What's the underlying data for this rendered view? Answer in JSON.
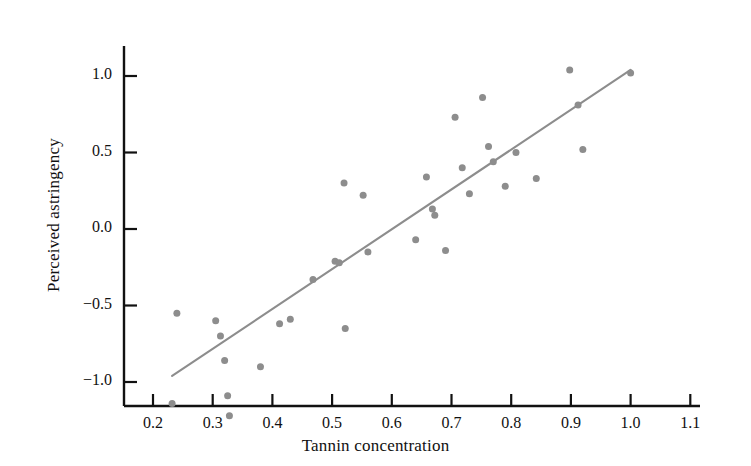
{
  "chart_data": {
    "type": "scatter",
    "title": "",
    "xlabel": "Tannin concentration",
    "ylabel": "Perceived astringency",
    "xlim": [
      0.155,
      1.155
    ],
    "ylim": [
      -1.27,
      1.17
    ],
    "xticks": [
      0.2,
      0.3,
      0.4,
      0.5,
      0.6,
      0.7,
      0.8,
      0.9,
      1.0,
      1.1
    ],
    "xticklabels": [
      "0.2",
      "0.3",
      "0.4",
      "0.5",
      "0.6",
      "0.7",
      "0.8",
      "0.9",
      "1.0",
      "1.1"
    ],
    "yticks": [
      -1.0,
      -0.5,
      0.0,
      0.5,
      1.0
    ],
    "yticklabels": [
      "-1.0",
      "-0.5",
      "0.0",
      "0.5",
      "1.0"
    ],
    "grid": false,
    "legend": false,
    "marker_color": "#8d8d8d",
    "marker_size": 7,
    "line_color": "#8d8d8d",
    "axis_color": "#111111",
    "points": [
      {
        "x": 0.232,
        "y": -1.14
      },
      {
        "x": 0.24,
        "y": -0.55
      },
      {
        "x": 0.305,
        "y": -0.6
      },
      {
        "x": 0.313,
        "y": -0.7
      },
      {
        "x": 0.32,
        "y": -0.86
      },
      {
        "x": 0.325,
        "y": -1.09
      },
      {
        "x": 0.328,
        "y": -1.22
      },
      {
        "x": 0.38,
        "y": -0.9
      },
      {
        "x": 0.412,
        "y": -0.62
      },
      {
        "x": 0.43,
        "y": -0.59
      },
      {
        "x": 0.468,
        "y": -0.33
      },
      {
        "x": 0.505,
        "y": -0.21
      },
      {
        "x": 0.512,
        "y": -0.22
      },
      {
        "x": 0.52,
        "y": 0.3
      },
      {
        "x": 0.522,
        "y": -0.65
      },
      {
        "x": 0.552,
        "y": 0.22
      },
      {
        "x": 0.56,
        "y": -0.15
      },
      {
        "x": 0.64,
        "y": -0.07
      },
      {
        "x": 0.658,
        "y": 0.34
      },
      {
        "x": 0.668,
        "y": 0.13
      },
      {
        "x": 0.672,
        "y": 0.09
      },
      {
        "x": 0.69,
        "y": -0.14
      },
      {
        "x": 0.706,
        "y": 0.73
      },
      {
        "x": 0.718,
        "y": 0.4
      },
      {
        "x": 0.73,
        "y": 0.23
      },
      {
        "x": 0.752,
        "y": 0.86
      },
      {
        "x": 0.762,
        "y": 0.54
      },
      {
        "x": 0.77,
        "y": 0.44
      },
      {
        "x": 0.79,
        "y": 0.28
      },
      {
        "x": 0.808,
        "y": 0.5
      },
      {
        "x": 0.842,
        "y": 0.33
      },
      {
        "x": 0.898,
        "y": 1.04
      },
      {
        "x": 0.912,
        "y": 0.81
      },
      {
        "x": 0.92,
        "y": 0.52
      },
      {
        "x": 1.0,
        "y": 1.02
      }
    ],
    "fit_line": {
      "x_start": 0.232,
      "y_start": -0.96,
      "x_end": 1.0,
      "y_end": 1.04
    }
  }
}
